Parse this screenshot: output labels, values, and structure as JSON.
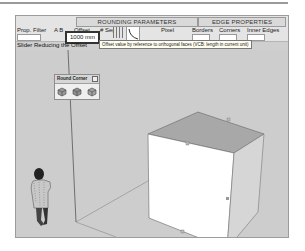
{
  "toolbar": {
    "sections": {
      "rounding": "ROUNDING PARAMETERS",
      "edge": "EDGE PROPERTIES"
    },
    "prop_filter_label": "Prop. Filter",
    "ab_label": "A B",
    "ab_sub": "A B",
    "offset_label": "Offset",
    "offset_value": "1000 mm",
    "segments_label": "# Seg.",
    "pixel_label": "Pixel",
    "pixel_sub": "1: 888 % F",
    "borders_label": "Borders",
    "corners_label": "Corners",
    "inner_edges_label": "Inner Edges",
    "tooltip": "Offset value by reference to orthogonal faces (VCB: length in current unit)",
    "hint": "Slider Reducing the Offset"
  },
  "panel": {
    "title": "Round Corner",
    "icons": [
      "round-corner-icon",
      "sharp-corner-icon",
      "bevel-corner-icon"
    ]
  },
  "colors": {
    "viewport_bg": "#cdcdcd",
    "cube_top": "#a8a8a8",
    "cube_front": "#ffffff",
    "cube_side": "#d6d6d6"
  }
}
